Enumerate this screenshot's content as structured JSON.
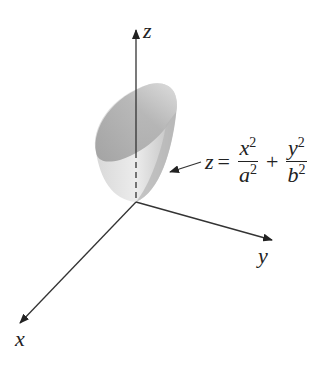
{
  "diagram": {
    "type": "elliptic-paraboloid",
    "axes": {
      "x": "x",
      "y": "y",
      "z": "z"
    },
    "equation": {
      "lhs": "z",
      "equals": "=",
      "term1": {
        "num": "x",
        "num_exp": "2",
        "den": "a",
        "den_exp": "2"
      },
      "plus": "+",
      "term2": {
        "num": "y",
        "num_exp": "2",
        "den": "b",
        "den_exp": "2"
      }
    },
    "colors": {
      "axis": "#333333",
      "surface_light": "#e6e6e6",
      "surface_dark": "#a8a8a8"
    }
  }
}
